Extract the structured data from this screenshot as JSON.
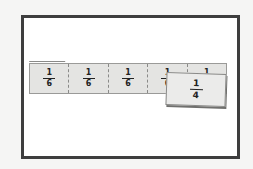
{
  "diagram": {
    "strip": {
      "pieces": [
        {
          "numerator": "1",
          "denominator": "6"
        },
        {
          "numerator": "1",
          "denominator": "6"
        },
        {
          "numerator": "1",
          "denominator": "6"
        },
        {
          "numerator": "1",
          "denominator": "6"
        },
        {
          "numerator": "1",
          "denominator": "6"
        }
      ]
    },
    "overlay_card": {
      "numerator": "1",
      "denominator": "4"
    },
    "colors": {
      "frame_border": "#3e3e3e",
      "frame_fill": "#ffffff",
      "strip_fill": "#e4e4e2",
      "card_fill": "#ebebea",
      "text": "#222222"
    }
  }
}
